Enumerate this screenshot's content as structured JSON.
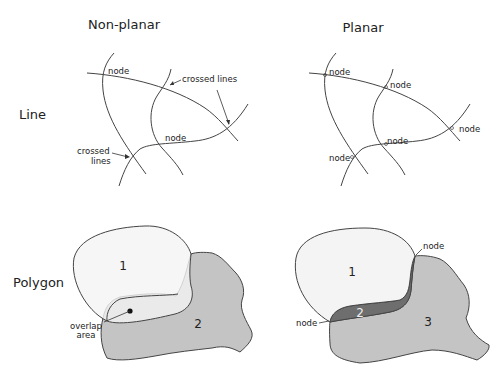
{
  "columns": {
    "nonplanar": {
      "title": "Non-planar"
    },
    "planar": {
      "title": "Planar"
    }
  },
  "rows": {
    "line": {
      "label": "Line"
    },
    "polygon": {
      "label": "Polygon"
    }
  },
  "line_nonplanar": {
    "labels": {
      "node_top": "node",
      "crossed_top": "crossed lines",
      "node_mid": "node",
      "crossed_left_1": "crossed",
      "crossed_left_2": "lines"
    }
  },
  "line_planar": {
    "labels": {
      "node_1": "node",
      "node_2": "node",
      "node_3": "node",
      "node_4": "node",
      "node_5": "node"
    }
  },
  "polygon_nonplanar": {
    "labels": {
      "poly_1": "1",
      "poly_2": "2",
      "overlap_1": "overlap",
      "overlap_2": "area"
    }
  },
  "polygon_planar": {
    "labels": {
      "poly_1": "1",
      "poly_2": "2",
      "poly_3": "3",
      "node_top": "node",
      "node_left": "node"
    }
  },
  "colors": {
    "polygon_light": "#f4f4f4",
    "polygon_mid": "#c4c4c4",
    "polygon_dark": "#6e6e6e",
    "stroke": "#444444"
  }
}
